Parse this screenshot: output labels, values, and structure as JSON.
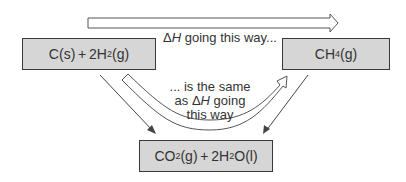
{
  "diagram": {
    "type": "hess-cycle",
    "nodes": {
      "reactants": {
        "label_main": "C(s) + 2H",
        "sub": "2",
        "label_tail": "(g)",
        "full": "C(s)+2H2(g)"
      },
      "product_direct": {
        "label_main": "CH",
        "sub": "4",
        "label_tail": "(g)",
        "full": "CH4(g)"
      },
      "combustion_products": {
        "part1": "CO",
        "sub1": "2",
        "part2": "(g) + 2H",
        "sub2": "2",
        "part3": "O(l)",
        "full": "CO2(g)+2H2O(l)"
      }
    },
    "labels": {
      "top": {
        "delta": "Δ",
        "H": "H",
        "text": " going this way..."
      },
      "middle": {
        "line1": "... is the same",
        "line2_prefix": "as Δ",
        "H": "H",
        "line2_suffix": " going",
        "line3": "this way"
      }
    },
    "edges": [
      {
        "from": "reactants",
        "to": "product_direct",
        "style": "open-arrow"
      },
      {
        "from": "reactants",
        "to": "combustion_products",
        "style": "thin-arrow"
      },
      {
        "from": "product_direct",
        "to": "combustion_products",
        "style": "thin-arrow"
      },
      {
        "from": "reactants",
        "to": "product_direct",
        "via": "combustion_products",
        "style": "curved-open-arrow"
      }
    ],
    "colors": {
      "box_fill": "#d6d6d6",
      "stroke": "#3a3a3a",
      "text": "#333333"
    }
  }
}
